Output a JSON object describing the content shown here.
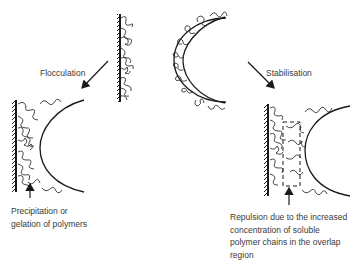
{
  "diagram": {
    "top": {
      "left_arrow_label": "Flocculation",
      "right_arrow_label": "Stabilisation"
    },
    "bottom_left": {
      "caption_lines": [
        "Precipitation or",
        "gelation of polymers"
      ]
    },
    "bottom_right": {
      "caption_lines": [
        "Repulsion due to the increased",
        "concentration of soluble",
        "polymer chains in the overlap",
        "region"
      ]
    },
    "colors": {
      "ink": "#1a1a1a",
      "text": "#3a3a3a",
      "background": "#ffffff"
    }
  }
}
